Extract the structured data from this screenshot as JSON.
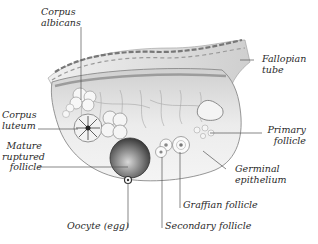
{
  "diagram": {
    "labels": {
      "corpus_albicans": "Corpus\nalbicans",
      "fallopian_tube": "Fallopian\ntube",
      "corpus_luteum": "Corpus\nluteum",
      "mature_ruptured_follicle": "Mature\nruptured\nfollicle",
      "primary_follicle": "Primary\nfollicle",
      "germinal_epithelium": "Germinal\nepithelium",
      "graafian_follicle": "Graffian follicle",
      "secondary_follicle": "Secondary follicle",
      "oocyte": "Oocyte (egg)"
    },
    "colors": {
      "background": "#ffffff",
      "label_text": "#2a2a2a",
      "leader_line": "#555555",
      "tissue_light": "#e6e6e6",
      "tissue_mid": "#b8b8b8",
      "tissue_dark": "#555555"
    }
  }
}
